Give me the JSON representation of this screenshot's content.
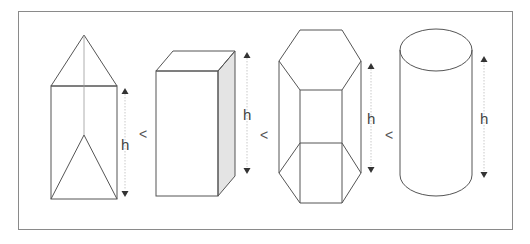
{
  "figure": {
    "shapes": [
      {
        "id": "triangular-prism",
        "label": "h"
      },
      {
        "id": "rectangular-prism",
        "label": "h"
      },
      {
        "id": "hexagonal-prism",
        "label": "h"
      },
      {
        "id": "cylinder",
        "label": "h"
      }
    ],
    "comparators": [
      "<",
      "<",
      "<"
    ],
    "colors": {
      "frame": "#8a8a8a",
      "stroke": "#555555",
      "shade": "#e4e4e4",
      "arrow": "#333333"
    }
  }
}
